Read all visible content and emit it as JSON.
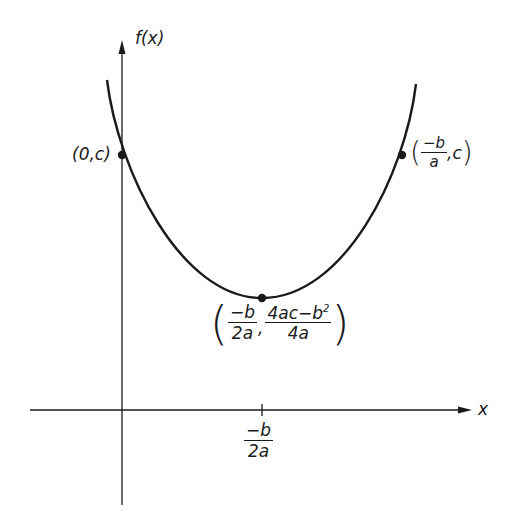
{
  "diagram": {
    "type": "parabola-graph",
    "axes": {
      "y_label": "f(x)",
      "x_label": "x"
    },
    "points": [
      {
        "id": "y-intercept",
        "label": "(0,c)"
      },
      {
        "id": "symmetric-point",
        "label_open": "(",
        "num": "−b",
        "den": "a",
        "suffix": ",c",
        "label_close": ")"
      },
      {
        "id": "vertex",
        "label_open": "(",
        "x_num": "−b",
        "x_den": "2a",
        "y_num": "4ac−b",
        "y_num_sup": "2",
        "y_den": "4a",
        "label_close": ")"
      }
    ],
    "x_tick": {
      "num": "−b",
      "den": "2a"
    },
    "colors": {
      "stroke": "#1a1a1a",
      "background": "#ffffff"
    }
  }
}
